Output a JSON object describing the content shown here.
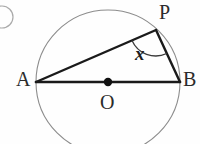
{
  "figure": {
    "kind": "circle-geometry-diagram",
    "background_color": "#fefefe",
    "stroke_color_outline": "#8c8c8c",
    "stroke_color_chord": "#1a1a1a",
    "label_color": "#2b2b2b",
    "question_marker": {
      "name": "question-number-bullet",
      "shape": "circle-outline-cropped"
    },
    "circle": {
      "center_label": "O",
      "center_x": 108,
      "center_y": 82,
      "radius": 72,
      "stroke_width": 1
    },
    "center_point": {
      "label": "O",
      "marker": "filled-dot",
      "radius": 4
    },
    "points": [
      {
        "label": "A",
        "x": 36,
        "y": 82,
        "label_x": 16,
        "label_y": 69
      },
      {
        "label": "B",
        "x": 180,
        "y": 82,
        "label_x": 183,
        "label_y": 69
      },
      {
        "label": "P",
        "x": 156,
        "y": 30,
        "label_x": 159,
        "label_y": 2
      }
    ],
    "segments": [
      {
        "name": "segment-AB",
        "from": "A",
        "to": "B",
        "stroke_width": 2.6
      },
      {
        "name": "segment-AP",
        "from": "A",
        "to": "P",
        "stroke_width": 2.4
      },
      {
        "name": "segment-PB",
        "from": "P",
        "to": "B",
        "stroke_width": 2.4
      }
    ],
    "angle": {
      "label": "x",
      "vertex": "P",
      "arc_radius": 26,
      "label_x": 135,
      "label_y": 44
    }
  }
}
